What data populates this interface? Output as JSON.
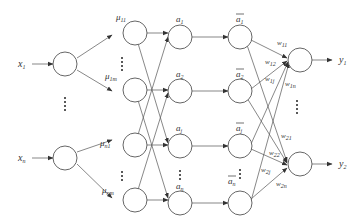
{
  "diagram": {
    "type": "fuzzy-neural-network",
    "colors": {
      "stroke": "#555555",
      "text": "#333333",
      "background": "#ffffff"
    },
    "inputs": [
      {
        "id": "x1",
        "label": "x",
        "sub": "1"
      },
      {
        "id": "xn",
        "label": "x",
        "sub": "n"
      }
    ],
    "membership": [
      {
        "id": "mu11",
        "label": "μ",
        "sub": "11"
      },
      {
        "id": "mu1m",
        "label": "μ",
        "sub": "1m"
      },
      {
        "id": "mun1",
        "label": "μ",
        "sub": "n1"
      },
      {
        "id": "munm",
        "label": "μ",
        "sub": "nm"
      }
    ],
    "rules": [
      {
        "id": "a1",
        "label": "a",
        "sub": "1"
      },
      {
        "id": "a2",
        "label": "a",
        "sub": "2"
      },
      {
        "id": "aj",
        "label": "a",
        "sub": "j"
      },
      {
        "id": "an",
        "label": "a",
        "sub": "n"
      }
    ],
    "normalized": [
      {
        "id": "abar1",
        "label": "a",
        "sub": "1"
      },
      {
        "id": "abar2",
        "label": "a",
        "sub": "2"
      },
      {
        "id": "abarj",
        "label": "a",
        "sub": "j"
      },
      {
        "id": "abarn",
        "label": "a",
        "sub": "n"
      }
    ],
    "outputs": [
      {
        "id": "y1",
        "label": "y",
        "sub": "1"
      },
      {
        "id": "y2",
        "label": "y",
        "sub": "2"
      }
    ],
    "weights": [
      {
        "id": "w11",
        "label": "w",
        "sub": "11"
      },
      {
        "id": "w12",
        "label": "w",
        "sub": "12"
      },
      {
        "id": "w1j",
        "label": "w",
        "sub": "1j"
      },
      {
        "id": "w1n",
        "label": "w",
        "sub": "1n"
      },
      {
        "id": "w21",
        "label": "w",
        "sub": "21"
      },
      {
        "id": "w22",
        "label": "w",
        "sub": "22"
      },
      {
        "id": "w2j",
        "label": "w",
        "sub": "2j"
      },
      {
        "id": "w2n",
        "label": "w",
        "sub": "2n"
      }
    ]
  }
}
